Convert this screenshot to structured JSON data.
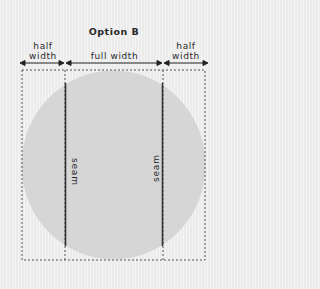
{
  "diagram": {
    "title": "Option B",
    "sections": [
      {
        "label_line1": "half",
        "label_line2": "width"
      },
      {
        "label_line1": "full width",
        "label_line2": ""
      },
      {
        "label_line1": "half",
        "label_line2": "width"
      }
    ],
    "seams": [
      {
        "label": "seam",
        "orientation": "top-to-bottom"
      },
      {
        "label": "seam",
        "orientation": "bottom-to-top"
      }
    ],
    "colors": {
      "background": "#efefef",
      "circle": "#d6d6d6",
      "seam_line": "#333333",
      "dashed_outline": "#555555",
      "text": "#2a2a2a"
    }
  }
}
